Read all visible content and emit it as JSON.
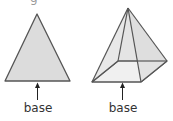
{
  "figure": {
    "top_fragment": "g",
    "shapes": [
      {
        "name": "triangle",
        "label": "base"
      },
      {
        "name": "square-pyramid",
        "label": "base"
      }
    ],
    "colors": {
      "stroke": "#555555",
      "face_fill": "#dcdcdc",
      "base_fill": "#eeeeee",
      "text": "#333333"
    }
  }
}
